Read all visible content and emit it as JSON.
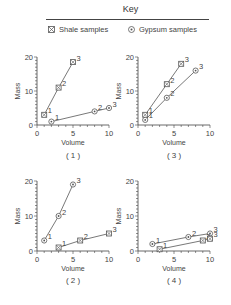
{
  "chart_data": {
    "type": "line",
    "key": {
      "title": "Key",
      "entries": [
        {
          "id": "shale",
          "label": "Shale samples",
          "marker": "square-with-x"
        },
        {
          "id": "gypsum",
          "label": "Gypsum samples",
          "marker": "circle-with-dot"
        }
      ]
    },
    "panels": [
      {
        "label": "( 1 )",
        "xlabel": "Volume",
        "ylabel": "Mass",
        "xlim": [
          0,
          10
        ],
        "ylim": [
          0,
          20
        ],
        "xticks": [
          0,
          5,
          10
        ],
        "yticks": [
          0,
          10,
          20
        ],
        "series": [
          {
            "sample": "shale",
            "points": [
              {
                "x": 1,
                "y": 3,
                "label": "1"
              },
              {
                "x": 3,
                "y": 11,
                "label": "2"
              },
              {
                "x": 5,
                "y": 18.5,
                "label": "3"
              }
            ]
          },
          {
            "sample": "gypsum",
            "points": [
              {
                "x": 2,
                "y": 1,
                "label": "1"
              },
              {
                "x": 8,
                "y": 4,
                "label": "2"
              },
              {
                "x": 10,
                "y": 5,
                "label": "3"
              }
            ]
          }
        ]
      },
      {
        "label": "( 3 )",
        "xlabel": "Volume",
        "ylabel": "Mass",
        "xlim": [
          0,
          10
        ],
        "ylim": [
          0,
          20
        ],
        "xticks": [
          0,
          5,
          10
        ],
        "yticks": [
          0,
          10,
          20
        ],
        "series": [
          {
            "sample": "shale",
            "points": [
              {
                "x": 1,
                "y": 3,
                "label": "1"
              },
              {
                "x": 4,
                "y": 12,
                "label": "2"
              },
              {
                "x": 6,
                "y": 18,
                "label": "3"
              }
            ]
          },
          {
            "sample": "gypsum",
            "points": [
              {
                "x": 1,
                "y": 1.5,
                "label": "1"
              },
              {
                "x": 4,
                "y": 8,
                "label": "2"
              },
              {
                "x": 8,
                "y": 16,
                "label": "3"
              }
            ]
          }
        ]
      },
      {
        "label": "( 2 )",
        "xlabel": "Volume",
        "ylabel": "Mass",
        "xlim": [
          0,
          10
        ],
        "ylim": [
          0,
          20
        ],
        "xticks": [
          0,
          5,
          10
        ],
        "yticks": [
          0,
          10,
          20
        ],
        "series": [
          {
            "sample": "gypsum",
            "points": [
              {
                "x": 1,
                "y": 3,
                "label": "1"
              },
              {
                "x": 3,
                "y": 10,
                "label": "2"
              },
              {
                "x": 5,
                "y": 19,
                "label": "3"
              }
            ]
          },
          {
            "sample": "shale",
            "points": [
              {
                "x": 3,
                "y": 1,
                "label": "1"
              },
              {
                "x": 6,
                "y": 3,
                "label": "2"
              },
              {
                "x": 10,
                "y": 5,
                "label": "3"
              }
            ]
          }
        ]
      },
      {
        "label": "( 4 )",
        "xlabel": "Volume",
        "ylabel": "Mass",
        "xlim": [
          0,
          10
        ],
        "ylim": [
          0,
          20
        ],
        "xticks": [
          0,
          5,
          10
        ],
        "yticks": [
          0,
          10,
          20
        ],
        "series": [
          {
            "sample": "gypsum",
            "points": [
              {
                "x": 2,
                "y": 2,
                "label": "1"
              },
              {
                "x": 7,
                "y": 4,
                "label": "2"
              },
              {
                "x": 10,
                "y": 5,
                "label": "3"
              }
            ]
          },
          {
            "sample": "shale",
            "points": [
              {
                "x": 3,
                "y": 0.5,
                "label": "1"
              },
              {
                "x": 9,
                "y": 3,
                "label": "2"
              },
              {
                "x": 10,
                "y": 3.5,
                "label": "3"
              }
            ]
          }
        ]
      }
    ]
  }
}
